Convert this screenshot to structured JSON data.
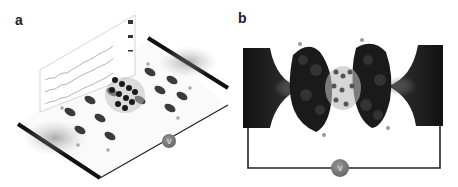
{
  "panels": [
    {
      "label": "a",
      "description": "3D perspective view of a molecular junction between two graphene-like electrodes with transmission plots and voltage source",
      "source_label": "V"
    },
    {
      "label": "b",
      "description": "Top view of molecular orbital isosurfaces bridging two electrodes connected through a voltage source",
      "source_label": "V"
    }
  ],
  "colors": {
    "electrode": "#1a1a1a",
    "orbital": "#222222",
    "source": "#7a7a7a",
    "wire": "#222222",
    "background": "#ffffff"
  }
}
